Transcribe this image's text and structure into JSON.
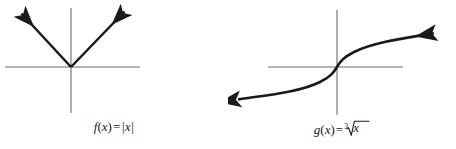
{
  "figure": {
    "background_color": "#ffffff",
    "axis_color": "#9a9a9a",
    "curve_color": "#1a1a1a",
    "panels": [
      {
        "id": "absolute-value",
        "caption_function": "f",
        "caption_variable": "x",
        "caption_equals": "=",
        "caption_expression": "|x|",
        "caption_full": "f(x) = |x|",
        "graph_type": "piecewise-linear-v",
        "arrow_count": 2,
        "axes": {
          "x_axis": {
            "x1": 5,
            "y1": 67,
            "x2": 140,
            "y2": 67
          },
          "y_axis": {
            "x1": 71,
            "y1": 8,
            "x2": 71,
            "y2": 113
          },
          "origin": {
            "x": 71,
            "y": 67
          }
        },
        "branches": [
          {
            "name": "left-branch",
            "from": {
              "x": 71,
              "y": 67
            },
            "to": {
              "x": 19,
              "y": 11
            }
          },
          {
            "name": "right-branch",
            "from": {
              "x": 71,
              "y": 67
            },
            "to": {
              "x": 127,
              "y": 9
            }
          }
        ]
      },
      {
        "id": "cube-root",
        "caption_function": "g",
        "caption_variable": "x",
        "caption_equals": "=",
        "caption_index": "3",
        "caption_radicand": "x",
        "caption_full": "g(x) = cube root of x",
        "graph_type": "cube-root-curve",
        "arrow_count": 2,
        "axes": {
          "x_axis": {
            "x1": 40,
            "y1": 67,
            "x2": 175,
            "y2": 67
          },
          "y_axis": {
            "x1": 109,
            "y1": 10,
            "x2": 109,
            "y2": 115
          },
          "origin": {
            "x": 109,
            "y": 67
          }
        },
        "endpoints": {
          "left_arrow_tip": {
            "x": 6,
            "y": 100
          },
          "right_arrow_tip": {
            "x": 212,
            "y": 31
          }
        }
      }
    ]
  }
}
